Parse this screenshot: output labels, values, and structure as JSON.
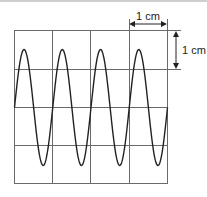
{
  "diagram": {
    "type": "oscilloscope-trace",
    "grid": {
      "columns": 4,
      "rows": 4,
      "cell_size_label": "1 cm"
    },
    "scale_labels": {
      "horizontal": "1 cm",
      "vertical": "1 cm"
    },
    "waveform": {
      "shape": "sine",
      "cycles_visible": 4,
      "amplitude_cm": 1.5,
      "period_cm": 1
    },
    "colors": {
      "grid": "#555555",
      "trace": "#222222",
      "background": "#ffffff"
    }
  }
}
